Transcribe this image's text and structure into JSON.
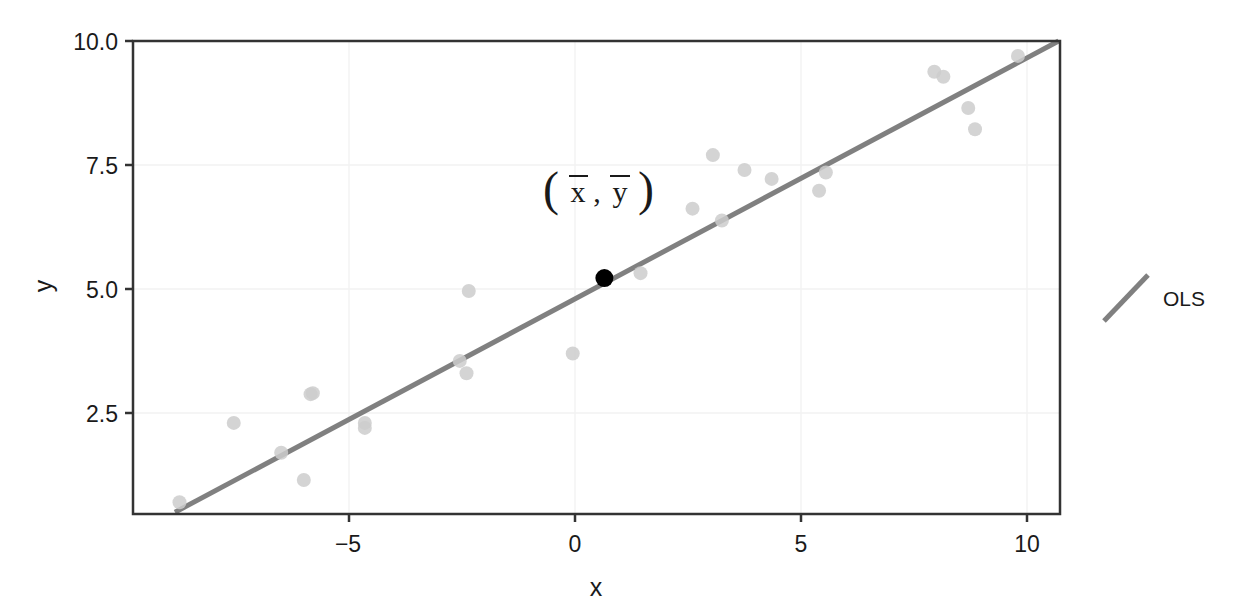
{
  "chart_data": {
    "type": "scatter",
    "title": "",
    "xlabel": "x",
    "ylabel": "y",
    "xlim": [
      -8.8,
      10.7
    ],
    "ylim": [
      0.35,
      10.2
    ],
    "xticks": [
      -5,
      0,
      5,
      10
    ],
    "xtick_labels": [
      "−5",
      "0",
      "5",
      "10"
    ],
    "yticks": [
      2.5,
      5.0,
      7.5,
      10.0
    ],
    "ytick_labels": [
      "2.5",
      "5.0",
      "7.5",
      "10.0"
    ],
    "grid": true,
    "grid_color": "#f2f2f2",
    "panel_border_color": "#333333",
    "background": "#ffffff",
    "point_color": "#cccccc",
    "point_radius": 7,
    "series": [
      {
        "name": "observations",
        "type": "scatter",
        "points": [
          {
            "x": -8.75,
            "y": 0.7
          },
          {
            "x": -7.55,
            "y": 2.3
          },
          {
            "x": -6.5,
            "y": 1.7
          },
          {
            "x": -6.0,
            "y": 1.15
          },
          {
            "x": -5.85,
            "y": 2.88
          },
          {
            "x": -5.8,
            "y": 2.9
          },
          {
            "x": -4.65,
            "y": 2.3
          },
          {
            "x": -4.65,
            "y": 2.2
          },
          {
            "x": -2.35,
            "y": 4.96
          },
          {
            "x": -2.55,
            "y": 3.55
          },
          {
            "x": -2.4,
            "y": 3.3
          },
          {
            "x": -0.05,
            "y": 3.7
          },
          {
            "x": 0.65,
            "y": 5.22
          },
          {
            "x": 1.45,
            "y": 5.32
          },
          {
            "x": 2.6,
            "y": 6.62
          },
          {
            "x": 3.05,
            "y": 7.7
          },
          {
            "x": 3.25,
            "y": 6.38
          },
          {
            "x": 3.75,
            "y": 7.4
          },
          {
            "x": 4.35,
            "y": 7.22
          },
          {
            "x": 5.4,
            "y": 6.98
          },
          {
            "x": 5.55,
            "y": 7.35
          },
          {
            "x": 7.95,
            "y": 9.38
          },
          {
            "x": 8.15,
            "y": 9.28
          },
          {
            "x": 8.7,
            "y": 8.65
          },
          {
            "x": 8.85,
            "y": 8.22
          },
          {
            "x": 9.8,
            "y": 9.7
          }
        ]
      },
      {
        "name": "mean-point",
        "type": "point",
        "label": "(x̄, ȳ)",
        "x": 0.65,
        "y": 5.22,
        "color": "#000000",
        "radius": 9
      },
      {
        "name": "OLS",
        "type": "line",
        "color": "#808080",
        "width": 5,
        "x_start": -8.85,
        "y_start": 0.5,
        "x_end": 10.7,
        "y_end": 10.0
      }
    ],
    "annotations": [
      {
        "name": "mean-point-label",
        "text": "(x̄, ȳ)",
        "x": 0.3,
        "y": 6.95
      }
    ],
    "legend": {
      "position": "right",
      "entries": [
        {
          "label": "OLS",
          "type": "line",
          "color": "#808080"
        }
      ]
    }
  },
  "axes": {
    "x_title": "x",
    "y_title": "y",
    "x_tick_labels": [
      "−5",
      "0",
      "5",
      "10"
    ],
    "y_tick_labels": [
      "10.0",
      "7.5",
      "5.0",
      "2.5"
    ]
  },
  "legend": {
    "ols_label": "OLS"
  },
  "annotation": {
    "open_paren": "(",
    "x_bar": "x",
    "comma": ",",
    "y_bar": "y",
    "close_paren": ")"
  },
  "colors": {
    "line": "#808080",
    "point": "#cccccc",
    "mean_point": "#000000",
    "frame": "#333333",
    "grid": "#f4f4f4",
    "text": "#1a1a1a"
  }
}
